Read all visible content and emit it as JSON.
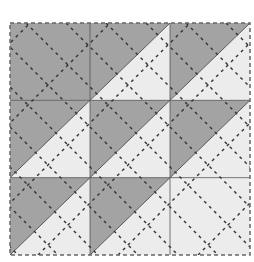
{
  "diagram": {
    "title": "",
    "type": "quilt-block",
    "grid": {
      "cols": 3,
      "rows": 3
    },
    "bounds": {
      "x0": 10,
      "y0": 23,
      "x1": 250,
      "y1": 255
    },
    "colors": {
      "dark": "#a3a3a3",
      "light": "#ececec",
      "seam": "#555555",
      "quilting_stitch": "#333333",
      "background": "#ffffff"
    },
    "cells": [
      {
        "row": 0,
        "col": 0,
        "type": "solid",
        "fill": "dark"
      },
      {
        "row": 0,
        "col": 1,
        "type": "half-square-triangle",
        "upper_left": "dark",
        "lower_right": "light"
      },
      {
        "row": 0,
        "col": 2,
        "type": "half-square-triangle",
        "upper_left": "dark",
        "lower_right": "light"
      },
      {
        "row": 1,
        "col": 0,
        "type": "half-square-triangle",
        "upper_left": "dark",
        "lower_right": "light"
      },
      {
        "row": 1,
        "col": 1,
        "type": "half-square-triangle",
        "upper_left": "dark",
        "lower_right": "light"
      },
      {
        "row": 1,
        "col": 2,
        "type": "half-square-triangle",
        "upper_left": "dark",
        "lower_right": "light"
      },
      {
        "row": 2,
        "col": 0,
        "type": "half-square-triangle",
        "upper_left": "dark",
        "lower_right": "light"
      },
      {
        "row": 2,
        "col": 1,
        "type": "half-square-triangle",
        "upper_left": "dark",
        "lower_right": "light"
      },
      {
        "row": 2,
        "col": 2,
        "type": "solid",
        "fill": "light"
      }
    ],
    "quilting_lines": "dashed diagonal stitch lines running parallel in both diagonal directions"
  }
}
